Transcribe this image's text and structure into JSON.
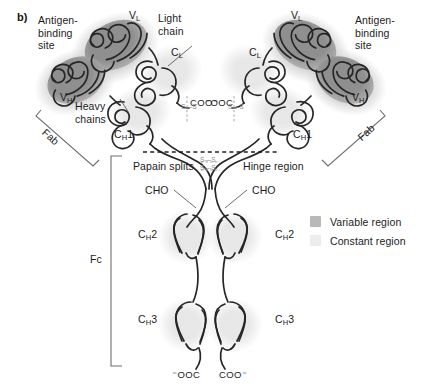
{
  "figure": {
    "panel_letter": "b)",
    "title_hidden": "",
    "background_color": "#ffffff"
  },
  "colors": {
    "variable_region": "#9a9a9a",
    "variable_region_halo": "#cfcfcf",
    "constant_region": "#e6e6e6",
    "chain_stroke": "#262626",
    "disulfide": "#9a9a9a",
    "bracket": "#6e6e6e",
    "text": "#1c1c1c"
  },
  "labels": {
    "antigen_binding_site_left": "Antigen-\nbinding\nsite",
    "antigen_binding_site_right": "Antigen-\nbinding\nsite",
    "light_chain": "Light\nchain",
    "heavy_chains": "Heavy\nchains",
    "papain_splits": "Papain splits",
    "hinge_region": "Hinge region",
    "fab_left": "Fab",
    "fab_right": "Fab",
    "fc": "Fc",
    "cho_left": "CHO",
    "cho_right": "CHO"
  },
  "domains": {
    "vl_left": "V",
    "vl_left_sub": "L",
    "vl_right": "V",
    "vl_right_sub": "L",
    "vh_left": "V",
    "vh_left_sub": "H",
    "vh_right": "V",
    "vh_right_sub": "H",
    "cl_left": "C",
    "cl_left_sub": "L",
    "cl_right": "C",
    "cl_right_sub": "L",
    "ch1_left": "C",
    "ch1_left_sub": "H",
    "ch1_left_num": "1",
    "ch1_right": "C",
    "ch1_right_sub": "H",
    "ch1_right_num": "1",
    "ch2_left": "C",
    "ch2_left_sub": "H",
    "ch2_left_num": "2",
    "ch2_right": "C",
    "ch2_right_sub": "H",
    "ch2_right_num": "2",
    "ch3_left": "C",
    "ch3_left_sub": "H",
    "ch3_left_num": "3",
    "ch3_right": "C",
    "ch3_right_sub": "H",
    "ch3_right_num": "3"
  },
  "termini": {
    "light_left": "COO⁻",
    "light_right": "⁻OOC",
    "heavy_left": "⁻OOC",
    "heavy_right": "COO⁻"
  },
  "disulfides": {
    "label": "S—S",
    "hinge_count": 2,
    "interchain_count": 2
  },
  "legend": {
    "items": [
      {
        "label": "Variable region",
        "color": "#b9b9b9"
      },
      {
        "label": "Constant region",
        "color": "#ededed"
      }
    ]
  }
}
